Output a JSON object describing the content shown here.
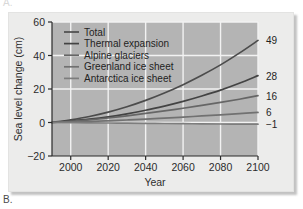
{
  "figure": {
    "panel_label_top": "A.",
    "panel_label_bottom": "B."
  },
  "chart_data": {
    "type": "line",
    "title": "",
    "xlabel": "Year",
    "ylabel": "Sea level change (cm)",
    "xlim": [
      1990,
      2100
    ],
    "ylim": [
      -20,
      60
    ],
    "xticks": [
      2000,
      2020,
      2040,
      2060,
      2080,
      2100
    ],
    "yticks": [
      -20,
      0,
      20,
      40,
      60
    ],
    "xtick_labels": [
      "2000",
      "2020",
      "2040",
      "2060",
      "2080",
      "2100"
    ],
    "ytick_labels": [
      "-20",
      "0",
      "20",
      "40",
      "60"
    ],
    "grid": true,
    "legend_position": "upper-left",
    "x": [
      1990,
      2000,
      2010,
      2020,
      2030,
      2040,
      2050,
      2060,
      2070,
      2080,
      2090,
      2100
    ],
    "series": [
      {
        "name": "Total",
        "color": "#4c4c4c",
        "end_label": "49",
        "end_value": 49,
        "values": [
          0,
          1.6,
          3.6,
          6.2,
          9.4,
          13.2,
          17.6,
          22.6,
          28.2,
          34.4,
          41.4,
          49
        ]
      },
      {
        "name": "Thermal expansion",
        "color": "#434343",
        "end_label": "28",
        "end_value": 28,
        "values": [
          0,
          0.9,
          2.0,
          3.4,
          5.2,
          7.3,
          9.8,
          12.6,
          15.8,
          19.3,
          23.4,
          28
        ]
      },
      {
        "name": "Alpine glaciers",
        "color": "#666666",
        "end_label": "16",
        "end_value": 16,
        "values": [
          0,
          0.7,
          1.6,
          2.7,
          4.0,
          5.4,
          6.9,
          8.5,
          10.2,
          12.0,
          13.9,
          16
        ]
      },
      {
        "name": "Greenland ice sheet",
        "color": "#717171",
        "end_label": "6",
        "end_value": 6,
        "values": [
          0,
          0.3,
          0.6,
          1.0,
          1.5,
          2.0,
          2.6,
          3.2,
          3.9,
          4.6,
          5.3,
          6
        ]
      },
      {
        "name": "Antarctica ice sheet",
        "color": "#7d7d7d",
        "end_label": "-1",
        "end_value": -1,
        "values": [
          0,
          -0.1,
          -0.2,
          -0.3,
          -0.4,
          -0.5,
          -0.6,
          -0.7,
          -0.8,
          -0.9,
          -0.95,
          -1
        ]
      }
    ]
  },
  "colors": {
    "plot_background": "#b4b4b4",
    "plate_background": "#ececeb",
    "gridline": "#f2f2f2",
    "axis_text": "#2b2b2b"
  }
}
